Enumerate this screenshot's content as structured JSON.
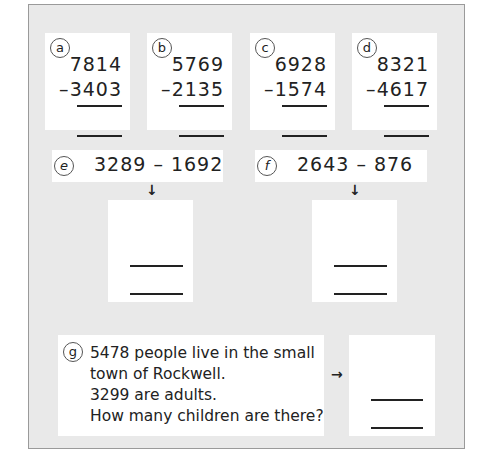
{
  "worksheet": {
    "problems": [
      {
        "label": "a",
        "top": "7814",
        "bottom": "3403",
        "operator": "–"
      },
      {
        "label": "b",
        "top": "5769",
        "bottom": "2135",
        "operator": "–"
      },
      {
        "label": "c",
        "top": "6928",
        "bottom": "1574",
        "operator": "–"
      },
      {
        "label": "d",
        "top": "8321",
        "bottom": "4617",
        "operator": "–"
      }
    ],
    "horizontal": [
      {
        "label": "e",
        "expression": "3289 – 1692",
        "arrow": "↓"
      },
      {
        "label": "f",
        "expression": "2643 – 876",
        "arrow": "↓"
      }
    ],
    "word_problem": {
      "label": "g",
      "lines": [
        "5478 people live in the small",
        "town of Rockwell.",
        "3299 are adults.",
        "How many children are there?"
      ],
      "arrow": "→"
    }
  }
}
